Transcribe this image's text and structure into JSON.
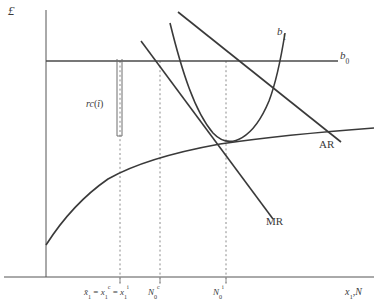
{
  "figure": {
    "axes": {
      "y_label": "£",
      "x_label_base": "x",
      "x_label_sub": "1",
      "x_label_rest": ",N",
      "x_label_full": "x1,N"
    },
    "curve_labels": {
      "b1_base": "b",
      "b1_sub": "1",
      "b0_base": "b",
      "b0_sub": "0",
      "ar": "AR",
      "mr": "MR"
    },
    "bracket_label": {
      "base": "rc",
      "paren_open": "(",
      "hat_var": "î",
      "paren_close": ")"
    },
    "tick_labels": [
      {
        "id": "tick-1",
        "parts": [
          {
            "text": "x̄",
            "style": "italic"
          },
          {
            "text": "1",
            "style": "sub"
          },
          {
            "text": " = ",
            "style": "plain"
          },
          {
            "text": "x",
            "style": "italic"
          },
          {
            "text": "1",
            "style": "sub"
          },
          {
            "text": "c",
            "style": "sup"
          },
          {
            "text": " = ",
            "style": "plain"
          },
          {
            "text": "x",
            "style": "italic"
          },
          {
            "text": "1",
            "style": "sub"
          },
          {
            "text": "i",
            "style": "sup"
          }
        ],
        "plain": "x̄1 = x1c = x1i"
      },
      {
        "id": "tick-2",
        "parts": [
          {
            "text": "N",
            "style": "italic"
          },
          {
            "text": "0",
            "style": "sub"
          },
          {
            "text": "c",
            "style": "sup"
          }
        ],
        "plain": "N0c"
      },
      {
        "id": "tick-3",
        "parts": [
          {
            "text": "N",
            "style": "italic"
          },
          {
            "text": "0",
            "style": "sub"
          },
          {
            "text": "i",
            "style": "sup"
          }
        ],
        "plain": "N0i"
      }
    ],
    "colors": {
      "curve": "#3a3a3a",
      "axis": "#555555",
      "dashed": "#8c8c8c",
      "background": "#ffffff",
      "text": "#3a3a3a"
    }
  },
  "chart_data": {
    "type": "line",
    "title": "",
    "xlabel": "x1,N",
    "ylabel": "£",
    "grid": false,
    "legend": "inline-curve-labels",
    "axis_origin_px": [
      46,
      277
    ],
    "series": [
      {
        "name": "b0",
        "description": "horizontal constant benefit line",
        "type": "straight",
        "points": [
          [
            46,
            61
          ],
          [
            338,
            61
          ]
        ],
        "label": "b0",
        "label_pos": [
          340,
          55
        ]
      },
      {
        "name": "b1",
        "description": "U-shaped / upward-sloping convex cost curve",
        "type": "curve",
        "points": [
          [
            171,
            24
          ],
          [
            186,
            80
          ],
          [
            199,
            118
          ],
          [
            214,
            136
          ],
          [
            232,
            138
          ],
          [
            252,
            124
          ],
          [
            268,
            96
          ],
          [
            278,
            62
          ],
          [
            284,
            36
          ]
        ],
        "label": "b1",
        "label_pos": [
          277,
          26
        ]
      },
      {
        "name": "AR",
        "description": "downward sloping average revenue line",
        "type": "straight",
        "points": [
          [
            178,
            12
          ],
          [
            340,
            141
          ]
        ],
        "label": "AR",
        "label_pos": [
          319,
          139
        ]
      },
      {
        "name": "MR",
        "description": "downward sloping marginal revenue line, steeper than AR",
        "type": "straight",
        "points": [
          [
            141,
            41
          ],
          [
            273,
            219
          ]
        ],
        "label": "MR",
        "label_pos": [
          266,
          216
        ]
      },
      {
        "name": "rising-concave",
        "description": "concave increasing curve from y-axis",
        "type": "curve",
        "points": [
          [
            46,
            245
          ],
          [
            62,
            219
          ],
          [
            82,
            196
          ],
          [
            106,
            178
          ],
          [
            134,
            165
          ],
          [
            168,
            155
          ],
          [
            205,
            147
          ],
          [
            245,
            141
          ],
          [
            290,
            136
          ],
          [
            330,
            132
          ],
          [
            374,
            129
          ]
        ],
        "label": "",
        "label_pos": null
      }
    ],
    "vertical_dashed_lines": [
      {
        "x": 120,
        "y_top": 61,
        "y_bottom": 283,
        "tick_label": "x̄1 = x1c = x1i"
      },
      {
        "x": 160,
        "y_top": 61,
        "y_bottom": 283,
        "tick_label": "N0c"
      },
      {
        "x": 226,
        "y_top": 61,
        "y_bottom": 283,
        "tick_label": "N0i"
      }
    ],
    "bracket": {
      "description": "narrow double vertical line denoting rc(î) distance",
      "x_left": 117,
      "x_right": 122,
      "y_top": 59,
      "y_bottom": 136,
      "label": "rc(î)"
    }
  }
}
